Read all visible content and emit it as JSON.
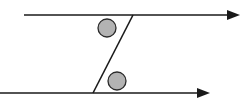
{
  "diagram": {
    "type": "parallel-lines-transversal",
    "colors": {
      "line": "#1a1a1a",
      "marker_fill": "#b3b3b3",
      "marker_stroke": "#2a2a2a",
      "background": "#ffffff"
    },
    "lines": [
      {
        "id": "top-parallel-line",
        "x1": 24,
        "y1": 15,
        "x2": 240,
        "y2": 15,
        "arrow": true
      },
      {
        "id": "bottom-parallel-line",
        "x1": 0,
        "y1": 93,
        "x2": 210,
        "y2": 93,
        "arrow": true
      },
      {
        "id": "transversal",
        "x1": 133,
        "y1": 15,
        "x2": 93,
        "y2": 93,
        "arrow": false
      }
    ],
    "angle_markers": [
      {
        "id": "angle-marker-top",
        "cx": 107,
        "cy": 28,
        "r": 9
      },
      {
        "id": "angle-marker-bottom",
        "cx": 117,
        "cy": 81,
        "r": 9
      }
    ]
  }
}
